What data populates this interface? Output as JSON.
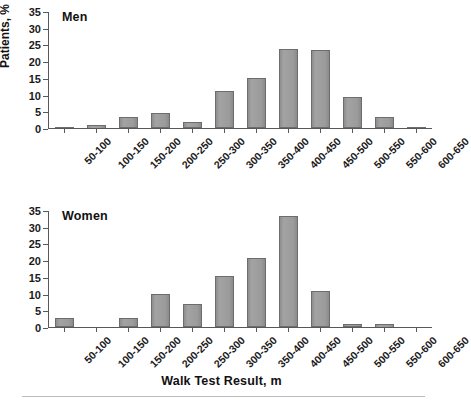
{
  "figure": {
    "y_axis_caption": "Patients, %",
    "x_axis_title": "Walk Test Result, m"
  },
  "panels": [
    {
      "id": "men",
      "title": "Men"
    },
    {
      "id": "women",
      "title": "Women"
    }
  ],
  "axis": {
    "y_ticks": [
      "0",
      "5",
      "10",
      "15",
      "20",
      "25",
      "30",
      "35"
    ],
    "x_categories": [
      "50-100",
      "100-150",
      "150-200",
      "200-250",
      "250-300",
      "300-350",
      "350-400",
      "400-450",
      "450-500",
      "500-550",
      "550-600",
      "600-650"
    ]
  },
  "colors": {
    "bar_fill": "#9a9a9a",
    "bar_border": "#6d6d6d",
    "axis": "#55595c",
    "text": "#1a1a1a",
    "rule": "#b9bcbe"
  },
  "chart_data": {
    "type": "bar",
    "title": "",
    "xlabel": "Walk Test Result, m",
    "ylabel": "Patients, %",
    "ylim": [
      0,
      35
    ],
    "yticks": [
      0,
      5,
      10,
      15,
      20,
      25,
      30,
      35
    ],
    "grid": false,
    "legend": "none",
    "panel_labels": [
      "Men",
      "Women"
    ],
    "categories": [
      "50-100",
      "100-150",
      "150-200",
      "200-250",
      "250-300",
      "300-350",
      "350-400",
      "400-450",
      "450-500",
      "500-550",
      "550-600",
      "600-650"
    ],
    "series": [
      {
        "name": "Men",
        "values": [
          0.1,
          0.8,
          3.3,
          4.6,
          1.9,
          11.0,
          15.0,
          23.6,
          23.4,
          9.3,
          3.4,
          0.3
        ]
      },
      {
        "name": "Women",
        "values": [
          2.6,
          0.0,
          2.7,
          10.0,
          6.8,
          15.3,
          20.8,
          33.3,
          10.8,
          0.9,
          0.8,
          0.0
        ]
      }
    ]
  }
}
